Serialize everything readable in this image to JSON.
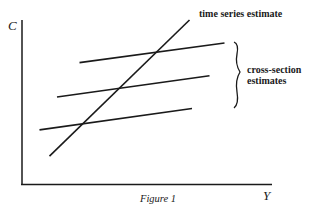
{
  "figure": {
    "caption": "Figure 1",
    "y_axis_label": "C",
    "x_axis_label": "Y",
    "time_series_label": "time series estimate",
    "cross_section_label_line1": "cross-section",
    "cross_section_label_line2": "estimates",
    "line_color": "#1a1a1a"
  },
  "chart_data": {
    "type": "line",
    "title": "Figure 1",
    "xlabel": "Y",
    "ylabel": "C",
    "annotations": [
      "time series estimate",
      "cross-section estimates"
    ],
    "series": [
      {
        "name": "time series estimate",
        "points": [
          [
            0.11,
            0.17
          ],
          [
            0.67,
            1.0
          ]
        ]
      },
      {
        "name": "cross-section estimate 1",
        "points": [
          [
            0.23,
            0.74
          ],
          [
            0.81,
            0.86
          ]
        ]
      },
      {
        "name": "cross-section estimate 2",
        "points": [
          [
            0.14,
            0.53
          ],
          [
            0.75,
            0.66
          ]
        ]
      },
      {
        "name": "cross-section estimate 3",
        "points": [
          [
            0.07,
            0.33
          ],
          [
            0.68,
            0.46
          ]
        ]
      }
    ]
  }
}
